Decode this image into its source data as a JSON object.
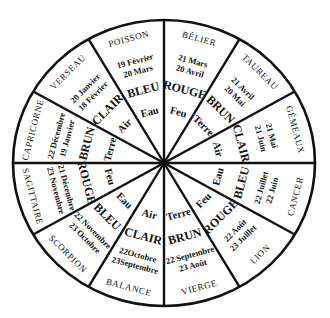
{
  "diagram": {
    "title": "",
    "geometry": {
      "cx": 164,
      "cy": 163,
      "rx": 151,
      "ry": 143
    },
    "colors": {
      "stroke": "#111111",
      "background": "#ffffff"
    },
    "signs": [
      {
        "name": "BÉLIER",
        "dates": [
          "21 Mars",
          "20 Avril"
        ],
        "color": "ROUGE",
        "element": "Feu"
      },
      {
        "name": "TAUREAU",
        "dates": [
          "21 Avril",
          "20 Mai"
        ],
        "color": "BRUN",
        "element": "Terre"
      },
      {
        "name": "GÉMEAUX",
        "dates": [
          "21 Mai",
          "21 Juin"
        ],
        "color": "CLAIR",
        "element": "Air"
      },
      {
        "name": "CANCER",
        "dates": [
          "22 Juin",
          "22 Juillet"
        ],
        "color": "BLEU",
        "element": "Eau"
      },
      {
        "name": "LION",
        "dates": [
          "23 Juillet",
          "22 Août"
        ],
        "color": "ROUGE",
        "element": "Feu"
      },
      {
        "name": "VIERGE",
        "dates": [
          "23 Août",
          "22 Septembre"
        ],
        "color": "BRUN",
        "element": "Terre"
      },
      {
        "name": "BALANCE",
        "dates": [
          "23Septembre",
          "22Octobre"
        ],
        "color": "CLAIR",
        "element": "Air"
      },
      {
        "name": "SCORPION",
        "dates": [
          "23 Octobre",
          "22 Novembre"
        ],
        "color": "BLEU",
        "element": "Eau"
      },
      {
        "name": "SAGITTAIRE",
        "dates": [
          "23 Novembre",
          "21 Décembre"
        ],
        "color": "ROUGE",
        "element": "Feu"
      },
      {
        "name": "CAPRICORNE",
        "dates": [
          "22 Décembre",
          "19 Janvier"
        ],
        "color": "BRUN",
        "element": "Terre"
      },
      {
        "name": "VERSEAU",
        "dates": [
          "20 Janvier",
          "18 Février"
        ],
        "color": "CLAIR",
        "element": "Air"
      },
      {
        "name": "POISSON",
        "dates": [
          "19 Février",
          "20 Mars"
        ],
        "color": "BLEU",
        "element": "Eau"
      }
    ]
  }
}
